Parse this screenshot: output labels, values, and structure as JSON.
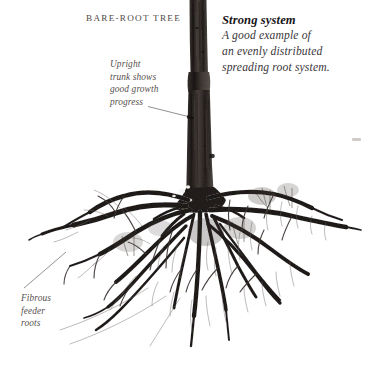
{
  "figure": {
    "heading_label": "BARE-ROOT TREE",
    "background_color": "#ffffff",
    "trunk_color": "#2f2a27",
    "root_color": "#241f1d",
    "leader_line_color": "#716b68",
    "label_text_color": "#4f4a47"
  },
  "caption": {
    "title": "Strong system",
    "line1": "A good example of",
    "line2": "an evenly distributed",
    "line3": "spreading root system."
  },
  "annotations": {
    "upright": {
      "line1": "Upright",
      "line2": "trunk shows",
      "line3": "good growth",
      "line4": "progress"
    },
    "fibrous": {
      "line1": "Fibrous",
      "line2": "feeder",
      "line3": "roots"
    }
  },
  "subject": {
    "name": "bare-root-tree-photograph",
    "trunk_top_y": 0,
    "trunk_base_y": 210,
    "root_spread_left_x": 28,
    "root_spread_right_x": 360,
    "root_depth_bottom_y": 352
  }
}
